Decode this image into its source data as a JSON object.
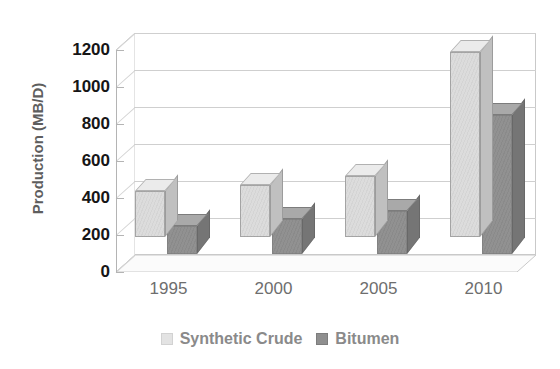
{
  "chart_data": {
    "type": "bar",
    "title": "",
    "subtitle": "",
    "xlabel": "",
    "ylabel": "Production (MB/D)",
    "categories": [
      "1995",
      "2000",
      "2005",
      "2010"
    ],
    "series": [
      {
        "name": "Synthetic Crude",
        "color": "#dcdcdc",
        "values": [
          250,
          280,
          330,
          1000
        ]
      },
      {
        "name": "Bitumen",
        "color": "#919191",
        "values": [
          150,
          190,
          230,
          750
        ]
      }
    ],
    "ylim": [
      0,
      1200
    ],
    "yticks": [
      0,
      200,
      400,
      600,
      800,
      1000,
      1200
    ],
    "ytick_labels": [
      "0",
      "200",
      "400",
      "600",
      "800",
      "1000",
      "1200"
    ],
    "grid": true,
    "grid_axis": "y",
    "legend_position": "bottom",
    "style": "3d-bar",
    "background": "#ffffff"
  },
  "axis": {
    "y_title": "Production (MB/D)"
  },
  "legend": {
    "entries": [
      {
        "label": "Synthetic Crude",
        "swatch": "light-gray-swatch"
      },
      {
        "label": "Bitumen",
        "swatch": "dark-gray-swatch"
      }
    ]
  }
}
